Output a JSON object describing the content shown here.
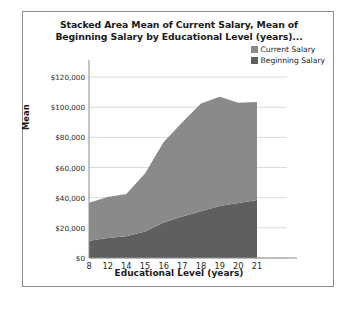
{
  "chart_data": {
    "type": "area",
    "stacked": true,
    "title": "Stacked Area Mean of Current Salary, Mean of Beginning Salary by Educational Level (years)...",
    "xlabel": "Educational Level (years)",
    "ylabel": "Mean",
    "categories": [
      "8",
      "12",
      "14",
      "15",
      "16",
      "17",
      "18",
      "19",
      "20",
      "21"
    ],
    "series": [
      {
        "name": "Beginning Salary",
        "color": "#5f5f5f",
        "values": [
          11500,
          13200,
          14500,
          17500,
          23500,
          27500,
          31000,
          34500,
          36500,
          38500
        ]
      },
      {
        "name": "Current Salary",
        "color": "#8a8a8a",
        "values": [
          25200,
          27300,
          28000,
          38500,
          53500,
          62500,
          71500,
          72500,
          66500,
          65000
        ]
      }
    ],
    "ytick_labels": [
      "$0",
      "$20,000",
      "$40,000",
      "$60,000",
      "$80,000",
      "$100,000",
      "$120,000"
    ],
    "ytick_values": [
      0,
      20000,
      40000,
      60000,
      80000,
      100000,
      120000
    ],
    "ylim": [
      0,
      130000
    ],
    "grid": true,
    "legend_position": "top-right"
  },
  "legend": {
    "items": [
      {
        "label": "Current Salary",
        "color": "#8a8a8a"
      },
      {
        "label": "Beginning Salary",
        "color": "#5f5f5f"
      }
    ]
  }
}
